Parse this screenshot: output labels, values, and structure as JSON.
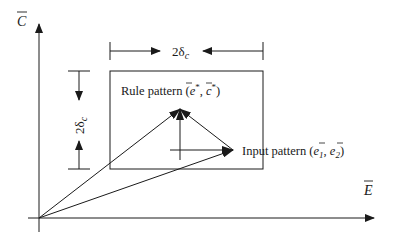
{
  "axes": {
    "y_label": "C",
    "x_label": "E",
    "y_label_overbar": true,
    "x_label_overbar": true
  },
  "dimension": {
    "prefix": "2δ",
    "subscript": "c"
  },
  "rule_pattern": {
    "label": "Rule pattern (",
    "v1": "e",
    "v1_sup": "*",
    "sep": ", ",
    "v2": "c",
    "v2_sup": "*",
    "close": ")"
  },
  "input_pattern": {
    "label": "Input pattern (",
    "v1": "e",
    "v1_sub": "1",
    "sep": ", ",
    "v2": "e",
    "v2_sub": "2",
    "close": ")"
  },
  "colors": {
    "ink": "#1a1a1a",
    "background": "#ffffff"
  }
}
